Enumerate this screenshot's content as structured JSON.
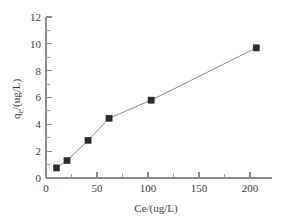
{
  "chart_data": {
    "type": "line",
    "title": "",
    "subtitle": "",
    "xlabel": "Ce/(ug/L)",
    "ylabel": "q_e/(ug/L)",
    "ylabel_base": "q",
    "ylabel_subscript": "e",
    "ylabel_rest": "/(ug/L)",
    "x": [
      10,
      20,
      40,
      60,
      100,
      200
    ],
    "values": [
      0.75,
      1.3,
      2.8,
      4.45,
      5.8,
      9.7
    ],
    "series": [
      {
        "name": "qe vs Ce",
        "x": [
          10,
          20,
          40,
          60,
          100,
          200
        ],
        "values": [
          0.75,
          1.3,
          2.8,
          4.45,
          5.8,
          9.7
        ]
      }
    ],
    "xlim": [
      0,
      215
    ],
    "ylim": [
      0,
      12
    ],
    "xticks": [
      0,
      50,
      100,
      150,
      200
    ],
    "xtick_labels": [
      "0",
      "50",
      "100",
      "150",
      "200"
    ],
    "yticks": [
      0,
      2,
      4,
      6,
      8,
      10,
      12
    ],
    "ytick_labels": [
      "0",
      "2",
      "4",
      "6",
      "8",
      "10",
      "12"
    ],
    "y_minor_ticks": [
      1,
      3,
      5,
      7,
      9,
      11
    ],
    "x_minor_ticks": [
      25,
      75,
      125,
      175
    ],
    "grid": false,
    "legend": false,
    "legend_position": "none",
    "marker": "square",
    "marker_color": "#2b2b2b",
    "line_color": "#8e8e8e",
    "axis_color": "#8a8a8a",
    "background": "#ffffff",
    "annotations": []
  }
}
